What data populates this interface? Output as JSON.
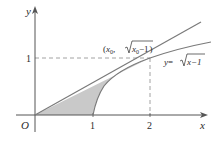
{
  "figure": {
    "type": "diagram",
    "axes": {
      "x_label": "x",
      "y_label": "y",
      "origin_label": "O",
      "x_ticks": [
        "1",
        "2"
      ],
      "y_ticks": [
        "1"
      ]
    },
    "labels": {
      "point_prefix": "(",
      "point_x": "x",
      "point_x_sub": "0",
      "point_sep": ", ",
      "point_sqrt_body": "x",
      "point_sqrt_sub": "0",
      "point_sqrt_tail": "−1",
      "point_suffix": ")",
      "curve_lhs": "y",
      "curve_eq": "=",
      "curve_sqrt_body": "x−1"
    },
    "curves": [
      {
        "name": "tangent-line",
        "equation": "y = x/2",
        "from": [
          0,
          0
        ],
        "to": [
          2.8,
          1.4
        ]
      },
      {
        "name": "sqrt-curve",
        "equation": "y = sqrt(x-1)",
        "from": [
          1,
          0
        ],
        "to": [
          3.1,
          1.45
        ]
      }
    ],
    "tangent_point": [
      2,
      1
    ],
    "shaded_region": "between y = x/2 and y = sqrt(x-1), x from 0 to 2",
    "colors": {
      "axis": "#555555",
      "curve": "#7a7a7a",
      "shade": "#c9c9c9",
      "dashed": "#8a8a8a",
      "text": "#2b2b2b"
    }
  }
}
